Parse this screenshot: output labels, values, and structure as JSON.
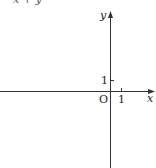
{
  "header": {
    "partial_text": "x + y"
  },
  "diagram": {
    "type": "coordinate-axes",
    "x_axis_label": "x",
    "y_axis_label": "y",
    "origin_label": "O",
    "x_tick_label": "1",
    "y_tick_label": "1",
    "axis_color": "#333333"
  }
}
